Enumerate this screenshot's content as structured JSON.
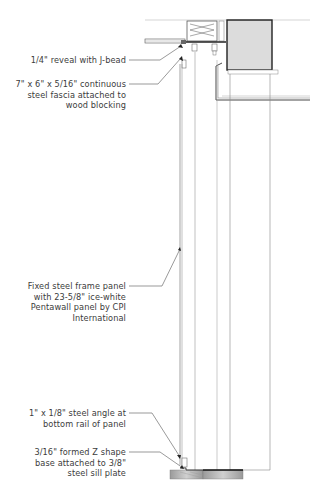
{
  "drawing": {
    "type": "architectural section detail",
    "colors": {
      "line": "#333333",
      "light_line": "#9a9a9a",
      "hatch": "#b0b0b0",
      "text": "#3c3c3c"
    }
  },
  "annotations": [
    {
      "id": "reveal",
      "text": "1/4\" reveal with J-bead"
    },
    {
      "id": "fascia",
      "text": "7\" x 6\" x 5/16\" continuous\nsteel fascia attached to\nwood blocking"
    },
    {
      "id": "panel",
      "text": "Fixed steel frame panel\nwith 23-5/8\" ice-white\nPentawall panel by CPI\nInternational"
    },
    {
      "id": "angle",
      "text": "1\" x 1/8\" steel angle at\nbottom rail of panel"
    },
    {
      "id": "base",
      "text": "3/16\" formed Z shape\nbase attached to 3/8\"\nsteel sill plate"
    }
  ]
}
